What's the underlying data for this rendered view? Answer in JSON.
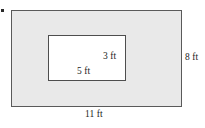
{
  "figure": {
    "type": "geometry-diagram",
    "marker": "•",
    "outer_rectangle": {
      "name": "outer-rectangle",
      "fill_color": "#e9e9e9",
      "border_color": "#5a5a5a",
      "width_label": "11 ft",
      "height_label": "8 ft"
    },
    "inner_rectangle": {
      "name": "inner-rectangle",
      "fill_color": "#ffffff",
      "border_color": "#4e4e4e",
      "width_label": "5 ft",
      "height_label": "3 ft"
    }
  }
}
